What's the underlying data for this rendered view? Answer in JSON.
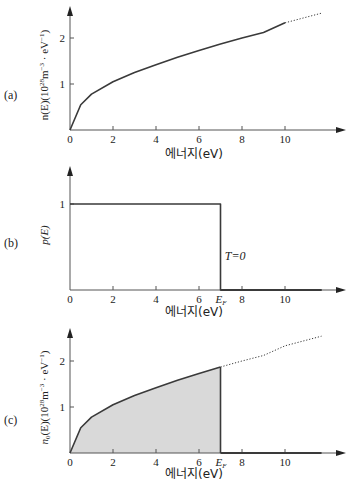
{
  "figure": {
    "x_axis_label": "에너지(eV)",
    "x_ticks": [
      0,
      2,
      4,
      6,
      8,
      10
    ],
    "fermi_label_main": "E",
    "fermi_label_sub": "F",
    "fermi_energy": 7.0,
    "colors": {
      "line": "#3a3a3a",
      "axis": "#555555",
      "fill": "#d9d9d9"
    }
  },
  "chart_data": [
    {
      "panel": "(a)",
      "type": "line",
      "title": "",
      "xlabel": "에너지(eV)",
      "ylabel": "n(E)(10^28 m^-3 · eV^-1)",
      "ylabel_parts": {
        "base": "n(E)(10",
        "exp1": "28",
        "mid": "m",
        "exp2": "−3",
        "dot": " · eV",
        "exp3": "−1",
        "end": ")"
      },
      "xlim": [
        0,
        12
      ],
      "ylim": [
        0,
        2.5
      ],
      "x_ticks": [
        0,
        2,
        4,
        6,
        8,
        10
      ],
      "y_ticks": [
        1,
        2
      ],
      "series": [
        {
          "name": "n(E) solid",
          "style": "solid",
          "x": [
            0,
            0.5,
            1,
            2,
            3,
            4,
            5,
            6,
            7,
            8,
            9,
            10
          ],
          "y": [
            0,
            0.55,
            0.78,
            1.05,
            1.25,
            1.42,
            1.58,
            1.73,
            1.87,
            2.0,
            2.12,
            2.33
          ]
        },
        {
          "name": "n(E) extrapolated",
          "style": "dotted",
          "x": [
            10,
            11.7
          ],
          "y": [
            2.33,
            2.54
          ]
        }
      ],
      "grid": false,
      "legend": null
    },
    {
      "panel": "(b)",
      "type": "line",
      "title": "",
      "xlabel": "에너지(eV)",
      "ylabel": "p(E)",
      "xlim": [
        0,
        12
      ],
      "ylim": [
        0,
        1.5
      ],
      "x_ticks": [
        0,
        2,
        4,
        6,
        "E_F",
        8,
        10
      ],
      "y_ticks": [
        1
      ],
      "series": [
        {
          "name": "p(E) T=0",
          "style": "solid",
          "x": [
            0,
            7.0,
            7.0,
            11.7
          ],
          "y": [
            1,
            1,
            0,
            0
          ]
        }
      ],
      "annotations": [
        {
          "text": "T = 0",
          "x": 7.2,
          "y": 0.4
        }
      ],
      "grid": false,
      "legend": null
    },
    {
      "panel": "(c)",
      "type": "area",
      "title": "",
      "xlabel": "에너지(eV)",
      "ylabel": "n0(E)(10^28 m^-3 · eV^-1)",
      "ylabel_parts": {
        "base": "n",
        "sub": "0",
        "rest": "(E)(10",
        "exp1": "28",
        "mid": "m",
        "exp2": "−3",
        "dot": " · eV",
        "exp3": "−1",
        "end": ")"
      },
      "xlim": [
        0,
        12
      ],
      "ylim": [
        0,
        2.5
      ],
      "x_ticks": [
        0,
        2,
        4,
        6,
        "E_F",
        8,
        10
      ],
      "y_ticks": [
        1,
        2
      ],
      "series": [
        {
          "name": "n0(E) occupied (shaded)",
          "style": "solid-filled",
          "x": [
            0,
            0.5,
            1,
            2,
            3,
            4,
            5,
            6,
            7
          ],
          "y": [
            0,
            0.55,
            0.78,
            1.05,
            1.25,
            1.42,
            1.58,
            1.73,
            1.87
          ]
        },
        {
          "name": "n(E) above E_F",
          "style": "dotted",
          "x": [
            7,
            8,
            9,
            10,
            11.7
          ],
          "y": [
            1.87,
            2.0,
            2.12,
            2.33,
            2.54
          ]
        },
        {
          "name": "zero above E_F",
          "style": "solid-bold",
          "x": [
            7,
            11.7
          ],
          "y": [
            0,
            0
          ]
        }
      ],
      "grid": false,
      "legend": null
    }
  ]
}
